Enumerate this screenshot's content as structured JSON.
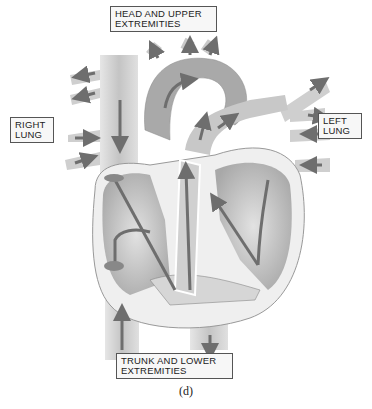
{
  "diagram": {
    "labels": {
      "head": [
        "HEAD AND UPPER",
        "EXTREMITIES"
      ],
      "right_lung": [
        "RIGHT",
        "LUNG"
      ],
      "left_lung": [
        "LEFT",
        "LUNG"
      ],
      "trunk": [
        "TRUNK AND LOWER",
        "EXTREMITIES"
      ]
    },
    "caption": "(d)",
    "colors": {
      "vessel": "#c9c9c9",
      "vessel_dark": "#8a8a8a",
      "chamber": "#d6d6d6",
      "wall": "#eeeeee",
      "arrow": "#6e6e6e",
      "outline": "#555555"
    }
  }
}
